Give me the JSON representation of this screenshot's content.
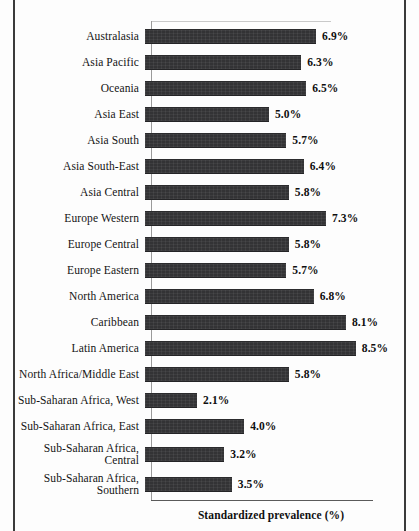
{
  "chart_data": {
    "type": "bar",
    "orientation": "horizontal",
    "title": "",
    "xlabel": "Standardized prevalence (%)",
    "ylabel": "",
    "grid": false,
    "legend": null,
    "xlim": [
      0,
      9
    ],
    "value_suffix": "%",
    "bar_color": "#333335",
    "categories": [
      "Australasia",
      "Asia Pacific",
      "Oceania",
      "Asia East",
      "Asia South",
      "Asia South-East",
      "Asia Central",
      "Europe Western",
      "Europe Central",
      "Europe Eastern",
      "North America",
      "Caribbean",
      "Latin America",
      "North Africa/Middle East",
      "Sub-Saharan Africa, West",
      "Sub-Saharan Africa, East",
      "Sub-Saharan Africa,\nCentral",
      "Sub-Saharan Africa,\nSouthern"
    ],
    "values": [
      6.9,
      6.3,
      6.5,
      5.0,
      5.7,
      6.4,
      5.8,
      7.3,
      5.8,
      5.7,
      6.8,
      8.1,
      8.5,
      5.8,
      2.1,
      4.0,
      3.2,
      3.5
    ],
    "value_labels": [
      "6.9%",
      "6.3%",
      "6.5%",
      "5.0%",
      "5.7%",
      "6.4%",
      "5.8%",
      "7.3%",
      "5.8%",
      "5.7%",
      "6.8%",
      "8.1%",
      "8.5%",
      "5.8%",
      "2.1%",
      "4.0%",
      "3.2%",
      "3.5%"
    ]
  }
}
